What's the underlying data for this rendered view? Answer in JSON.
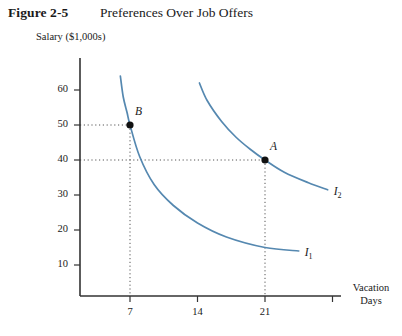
{
  "figure": {
    "number": "Figure 2-5",
    "title": "Preferences Over Job Offers"
  },
  "chart_data": {
    "type": "line",
    "title": "Preferences Over Job Offers",
    "xlabel": "Vacation Days",
    "ylabel": "Salary ($1,000s)",
    "xlim": [
      0,
      28
    ],
    "ylim": [
      0,
      68
    ],
    "grid": false,
    "legend_position": "inline-curve-end",
    "xticks": [
      7,
      14,
      21,
      28
    ],
    "xtick_labels": [
      "7",
      "14",
      "21",
      ""
    ],
    "yticks": [
      10,
      20,
      30,
      40,
      50,
      60
    ],
    "ytick_labels": [
      "10",
      "20",
      "30",
      "40",
      "50",
      "60"
    ],
    "curve_color": "#5588b0",
    "series": [
      {
        "name": "I1",
        "label": "I",
        "subscript": "1",
        "points": [
          {
            "x": 6.0,
            "y": 64.0
          },
          {
            "x": 6.3,
            "y": 58.0
          },
          {
            "x": 6.7,
            "y": 53.5
          },
          {
            "x": 7.0,
            "y": 50.0
          },
          {
            "x": 8.0,
            "y": 41.0
          },
          {
            "x": 9.5,
            "y": 33.0
          },
          {
            "x": 11.5,
            "y": 27.0
          },
          {
            "x": 14.0,
            "y": 22.0
          },
          {
            "x": 17.0,
            "y": 18.0
          },
          {
            "x": 21.0,
            "y": 15.0
          },
          {
            "x": 24.5,
            "y": 14.0
          }
        ]
      },
      {
        "name": "I2",
        "label": "I",
        "subscript": "2",
        "points": [
          {
            "x": 14.2,
            "y": 62.0
          },
          {
            "x": 15.0,
            "y": 57.0
          },
          {
            "x": 16.5,
            "y": 51.0
          },
          {
            "x": 18.0,
            "y": 46.5
          },
          {
            "x": 19.5,
            "y": 43.0
          },
          {
            "x": 21.0,
            "y": 40.0
          },
          {
            "x": 23.0,
            "y": 36.5
          },
          {
            "x": 25.5,
            "y": 33.5
          },
          {
            "x": 27.5,
            "y": 31.5
          }
        ]
      }
    ],
    "annotations": [
      {
        "name": "B",
        "x": 7,
        "y": 50,
        "marker": "dot",
        "guides": [
          "horizontal",
          "vertical"
        ]
      },
      {
        "name": "A",
        "x": 21,
        "y": 40,
        "marker": "dot",
        "guides": [
          "horizontal",
          "vertical"
        ]
      }
    ]
  }
}
